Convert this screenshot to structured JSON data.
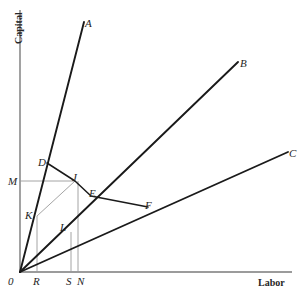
{
  "figure": {
    "kind": "isoquant-ray-diagram",
    "background_color": "#ffffff",
    "line_color": "#1a1a1a",
    "construction_line_color": "#9a9a9a",
    "axis_color": "#7a7a7a",
    "axes": {
      "y_title": "Capital",
      "x_title": "Labor",
      "origin_label": "0"
    },
    "tick_labels": {
      "x": [
        {
          "name": "R",
          "label": "R"
        },
        {
          "name": "S",
          "label": "S"
        },
        {
          "name": "N",
          "label": "N"
        }
      ],
      "y": [
        {
          "name": "M",
          "label": "M"
        }
      ]
    },
    "process_rays": [
      {
        "name": "A",
        "label": "A"
      },
      {
        "name": "B",
        "label": "B"
      },
      {
        "name": "C",
        "label": "C"
      }
    ],
    "points": [
      {
        "name": "D",
        "label": "D"
      },
      {
        "name": "J",
        "label": "J"
      },
      {
        "name": "E",
        "label": "E"
      },
      {
        "name": "F",
        "label": "F"
      },
      {
        "name": "K",
        "label": "K"
      },
      {
        "name": "L",
        "label": "L"
      }
    ]
  },
  "chart_data": {
    "type": "line",
    "title": "",
    "xlabel": "Labor",
    "ylabel": "Capital",
    "xlim": [
      0,
      300
    ],
    "ylim": [
      0,
      295
    ],
    "grid": false,
    "legend": "none",
    "origin_px": [
      20,
      272
    ],
    "series": [
      {
        "name": "ray-A",
        "label": "A",
        "kind": "process-ray",
        "points_px": [
          [
            20,
            272
          ],
          [
            84,
            22
          ]
        ],
        "label_px": [
          85,
          18
        ]
      },
      {
        "name": "ray-B",
        "label": "B",
        "kind": "process-ray",
        "points_px": [
          [
            20,
            272
          ],
          [
            238,
            62
          ]
        ],
        "label_px": [
          240,
          58
        ]
      },
      {
        "name": "ray-C",
        "label": "C",
        "kind": "process-ray",
        "points_px": [
          [
            20,
            272
          ],
          [
            288,
            152
          ]
        ],
        "label_px": [
          289,
          148
        ]
      },
      {
        "name": "isoquant-DJEF",
        "label": "D-J-E-F",
        "kind": "isoquant-polyline",
        "points_px": [
          [
            47,
            163
          ],
          [
            75,
            181
          ],
          [
            91,
            196
          ],
          [
            148,
            207
          ]
        ]
      },
      {
        "name": "construction-K-J",
        "label": "K to J",
        "kind": "construction",
        "points_px": [
          [
            37,
            216
          ],
          [
            75,
            181
          ]
        ]
      },
      {
        "name": "construction-M-line",
        "label": "M to J",
        "kind": "construction",
        "points_px": [
          [
            20,
            181
          ],
          [
            75,
            181
          ]
        ]
      },
      {
        "name": "construction-R-vertical",
        "label": "R vertical",
        "kind": "construction",
        "points_px": [
          [
            37,
            216
          ],
          [
            37,
            272
          ]
        ]
      },
      {
        "name": "construction-S-vertical",
        "label": "S vertical",
        "kind": "construction",
        "points_px": [
          [
            71,
            232
          ],
          [
            71,
            272
          ]
        ]
      },
      {
        "name": "construction-N-vertical",
        "label": "N vertical",
        "kind": "construction",
        "points_px": [
          [
            78,
            181
          ],
          [
            78,
            272
          ]
        ]
      }
    ],
    "annotations": [
      {
        "name": "A",
        "text": "A",
        "x_px": 85,
        "y_px": 18
      },
      {
        "name": "B",
        "text": "B",
        "x_px": 240,
        "y_px": 58
      },
      {
        "name": "C",
        "text": "C",
        "x_px": 289,
        "y_px": 148
      },
      {
        "name": "D",
        "text": "D",
        "x_px": 38,
        "y_px": 157
      },
      {
        "name": "J",
        "text": "J",
        "x_px": 72,
        "y_px": 172
      },
      {
        "name": "E",
        "text": "E",
        "x_px": 89,
        "y_px": 188
      },
      {
        "name": "F",
        "text": "F",
        "x_px": 145,
        "y_px": 200
      },
      {
        "name": "K",
        "text": "K",
        "x_px": 25,
        "y_px": 210
      },
      {
        "name": "L",
        "text": "L",
        "x_px": 60,
        "y_px": 222
      },
      {
        "name": "M",
        "text": "M",
        "x_px": 8,
        "y_px": 176
      },
      {
        "name": "0",
        "text": "0",
        "x_px": 8,
        "y_px": 276
      },
      {
        "name": "R",
        "text": "R",
        "x_px": 33,
        "y_px": 276
      },
      {
        "name": "S",
        "text": "S",
        "x_px": 66,
        "y_px": 276
      },
      {
        "name": "N",
        "text": "N",
        "x_px": 77,
        "y_px": 276
      }
    ]
  }
}
